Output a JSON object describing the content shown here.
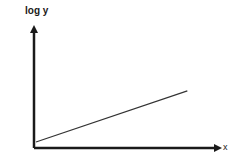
{
  "chart_data": {
    "type": "line",
    "title": "",
    "xlabel": "x",
    "ylabel": "log y",
    "grid": false,
    "legend": null,
    "ticks": {
      "x": [],
      "y": []
    },
    "series": [
      {
        "name": "log y vs x",
        "x": [
          0,
          1
        ],
        "y": [
          0.05,
          0.48
        ]
      }
    ],
    "xlim": [
      0,
      1.2
    ],
    "ylim": [
      0,
      1
    ],
    "annotations": [],
    "colors": {
      "axis": "#1a1a1a",
      "line": "#333333"
    }
  },
  "labels": {
    "ylabel": "log y",
    "xlabel": "x"
  }
}
